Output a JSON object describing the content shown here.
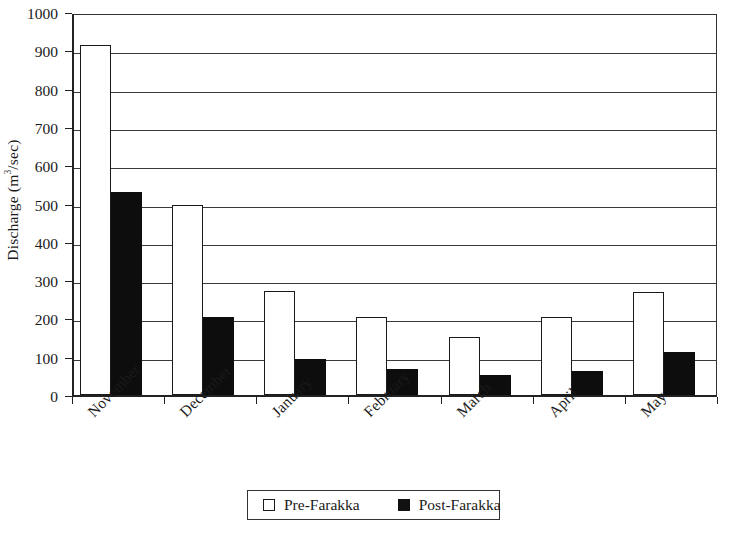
{
  "chart_data": {
    "type": "bar",
    "title": "",
    "xlabel": "",
    "ylabel": "Discharge (m³/sec)",
    "ylabel_main": "Discharge (m",
    "ylabel_sup": "3",
    "ylabel_tail": "/sec)",
    "ylim": [
      0,
      1000
    ],
    "ytick_step": 100,
    "grid": "horizontal",
    "legend_position": "bottom-center",
    "categories": [
      "November",
      "December",
      "January",
      "February",
      "March",
      "April",
      "May"
    ],
    "ytick_labels": [
      "1000",
      "900",
      "800",
      "700",
      "600",
      "500",
      "400",
      "300",
      "200",
      "100",
      "0"
    ],
    "ytick_values": [
      1000,
      900,
      800,
      700,
      600,
      500,
      400,
      300,
      200,
      100,
      0
    ],
    "series": [
      {
        "name": "Pre-Farakka",
        "style": "hollow",
        "color": "#ffffff",
        "edge_color": "#1a1a1a",
        "values": [
          915,
          497,
          272,
          205,
          152,
          203,
          268
        ]
      },
      {
        "name": "Post-Farakka",
        "style": "solid",
        "color": "#0d0d0d",
        "edge_color": "#0d0d0d",
        "values": [
          530,
          205,
          95,
          68,
          52,
          62,
          112
        ]
      }
    ]
  },
  "legend": {
    "entries": [
      {
        "label": "Pre-Farakka",
        "swatch": "hollow-square-icon"
      },
      {
        "label": "Post-Farakka",
        "swatch": "filled-square-icon"
      }
    ]
  },
  "colors": {
    "axis": "#222222",
    "grid": "#3a3a3a",
    "pre_fill": "#ffffff",
    "post_fill": "#0d0d0d",
    "background": "#ffffff"
  }
}
